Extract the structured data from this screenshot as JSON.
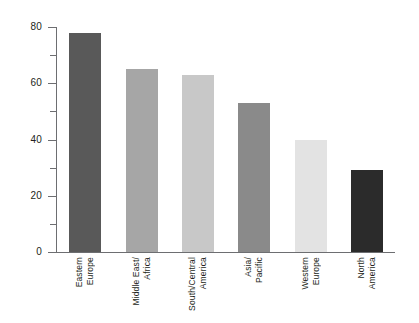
{
  "chart_data": {
    "type": "bar",
    "title": "",
    "xlabel": "",
    "ylabel": "",
    "ylim": [
      0,
      80
    ],
    "grid": false,
    "legend": "none",
    "categories": [
      "Eastern Europe",
      "Middle East/ Africa",
      "South/Central America",
      "Asia/ Pacific",
      "Western Europe",
      "North America"
    ],
    "category_lines": [
      [
        "Eastern",
        "Europe"
      ],
      [
        "Middle East/",
        "Africa"
      ],
      [
        "South/Central",
        "America"
      ],
      [
        "Asia/",
        "Pacific"
      ],
      [
        "Western",
        "Europe"
      ],
      [
        "North",
        "America"
      ]
    ],
    "values": [
      78,
      65,
      63,
      53,
      40,
      29
    ],
    "bar_colors": [
      "#595959",
      "#a6a6a6",
      "#c8c8c8",
      "#8a8a8a",
      "#e3e3e3",
      "#2b2b2b"
    ],
    "y_ticks_major": [
      0,
      20,
      40,
      60,
      80
    ],
    "y_ticks_minor": [
      10,
      30,
      50,
      70
    ],
    "y_tick_labels": [
      "0",
      "20",
      "40",
      "60",
      "80"
    ],
    "axis_color": "#6d6e71",
    "text_color": "#231f20",
    "background": "#ffffff"
  }
}
